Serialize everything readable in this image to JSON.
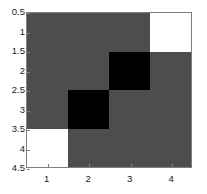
{
  "chart_data": {
    "type": "heatmap",
    "title": "",
    "subtitle": "",
    "xlabel": "",
    "ylabel": "",
    "nrows": 4,
    "ncols": 4,
    "xlim": [
      0.5,
      4.5
    ],
    "ylim": [
      0.5,
      4.5
    ],
    "grid": false,
    "legend": null,
    "colormap": [
      "#ffffff",
      "#4d4d4d",
      "#000000"
    ],
    "value_colors": {
      "white": "#ffffff",
      "gray": "#4d4d4d",
      "black": "#000000"
    },
    "matrix": [
      [
        "gray",
        "gray",
        "gray",
        "white"
      ],
      [
        "gray",
        "gray",
        "black",
        "gray"
      ],
      [
        "gray",
        "black",
        "gray",
        "gray"
      ],
      [
        "white",
        "gray",
        "gray",
        "gray"
      ]
    ],
    "values": [
      [
        0.5,
        0.5,
        0.5,
        1
      ],
      [
        0.5,
        0.5,
        0,
        0.5
      ],
      [
        0.5,
        0,
        0.5,
        0.5
      ],
      [
        1,
        0.5,
        0.5,
        0.5
      ]
    ],
    "xticks": [
      1,
      2,
      3,
      4
    ],
    "xticklabels": [
      "1",
      "2",
      "3",
      "4"
    ],
    "yticks": [
      0.5,
      1,
      1.5,
      2,
      2.5,
      3,
      3.5,
      4,
      4.5
    ],
    "yticklabels": [
      "0.5",
      "1",
      "1.5",
      "2",
      "2.5",
      "3",
      "3.5",
      "4",
      "4.5"
    ],
    "axis_color": "#808080",
    "background": "#ffffff"
  }
}
